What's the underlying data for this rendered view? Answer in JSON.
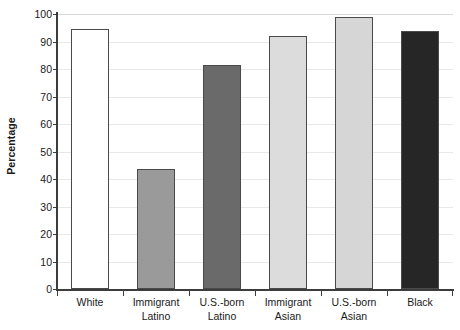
{
  "chart_data": {
    "type": "bar",
    "title": "",
    "xlabel": "",
    "ylabel": "Percentage",
    "ylim": [
      0,
      100
    ],
    "ytick_step": 10,
    "grid": true,
    "legend": "none",
    "categories": [
      "White",
      "Immigrant Latino",
      "U.S.-born Latino",
      "Immigrant Asian",
      "U.S.-born Asian",
      "Black"
    ],
    "category_lines": [
      [
        "White",
        ""
      ],
      [
        "Immigrant",
        "Latino"
      ],
      [
        "U.S.-born",
        "Latino"
      ],
      [
        "Immigrant",
        "Asian"
      ],
      [
        "U.S.-born",
        "Asian"
      ],
      [
        "Black",
        ""
      ]
    ],
    "values": [
      94.5,
      43.5,
      81.5,
      92,
      99,
      94
    ],
    "bar_colors": [
      "#ffffff",
      "#9a9a9a",
      "#6a6a6a",
      "#dcdcdc",
      "#d6d6d6",
      "#262626"
    ],
    "bar_edge_color": "#4a4a4a",
    "yticks": [
      0,
      10,
      20,
      30,
      40,
      50,
      60,
      70,
      80,
      90,
      100
    ],
    "ytick_labels": [
      "0",
      "10",
      "20",
      "30",
      "40",
      "50",
      "60",
      "70",
      "80",
      "90",
      "100"
    ],
    "grid_color": "#e8e8e8",
    "axis_color": "#3c3c3c",
    "background": "#ffffff"
  }
}
